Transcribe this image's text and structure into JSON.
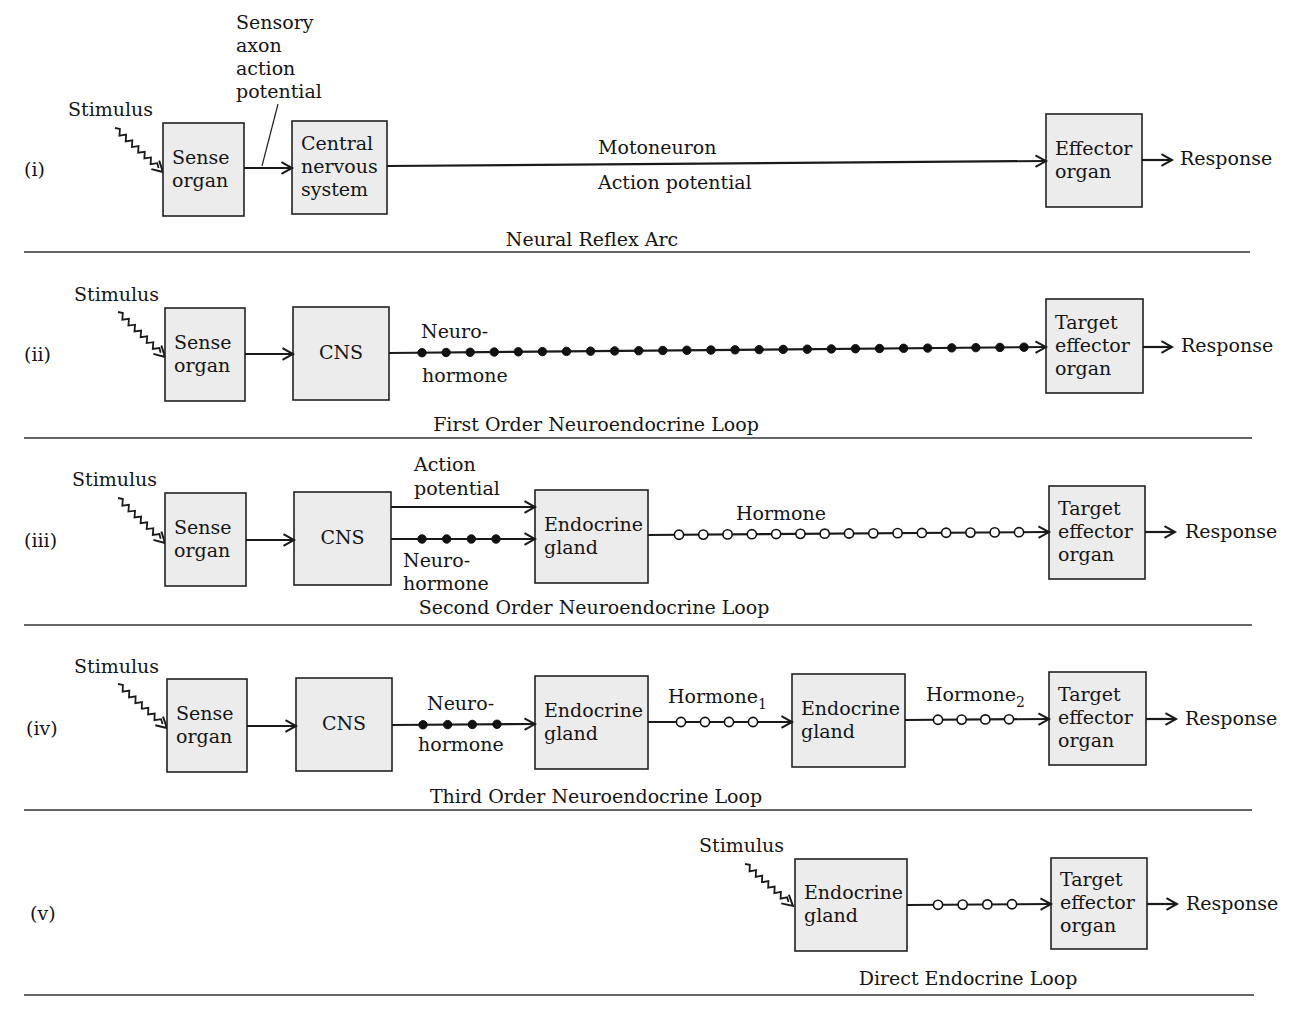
{
  "figure": {
    "panels": [
      {
        "id": "i",
        "numeral": "(i)",
        "caption": "Neural Reflex Arc",
        "numeral_pos": [
          24,
          176
        ],
        "caption_pos": [
          592,
          246
        ],
        "separator_y": 252,
        "separator_x": [
          24,
          1250
        ],
        "stimulus": {
          "label": "Stimulus",
          "label_pos": [
            68,
            116
          ],
          "from": [
            115,
            128
          ],
          "to": [
            163,
            172
          ]
        },
        "boxes": [
          {
            "id": "sense-organ",
            "lines": [
              "Sense",
              "organ"
            ],
            "x": 163,
            "y": 123,
            "w": 81,
            "h": 93
          },
          {
            "id": "central-nervous-system",
            "lines": [
              "Central",
              "nervous",
              "system"
            ],
            "x": 292,
            "y": 121,
            "w": 95,
            "h": 93
          },
          {
            "id": "effector-organ",
            "lines": [
              "Effector",
              "organ"
            ],
            "x": 1046,
            "y": 114,
            "w": 96,
            "h": 93
          }
        ],
        "connections": [
          {
            "from": [
              244,
              168
            ],
            "to": [
              292,
              168
            ],
            "style": "plain",
            "dots": 0
          },
          {
            "from": [
              387,
              166
            ],
            "to": [
              1046,
              161
            ],
            "style": "plain",
            "dots": 0
          },
          {
            "from": [
              1142,
              160
            ],
            "to": [
              1172,
              160
            ],
            "style": "plain",
            "dots": 0
          }
        ],
        "labels": [
          {
            "id": "sensory-axon-label",
            "lines": [
              "Sensory",
              "axon",
              "action",
              "potential"
            ],
            "x": 236,
            "y": 29,
            "lh": 23
          },
          {
            "id": "motoneuron-label",
            "lines": [
              "Motoneuron"
            ],
            "x": 598,
            "y": 154,
            "lh": 22
          },
          {
            "id": "action-potential-label",
            "lines": [
              "Action potential"
            ],
            "x": 598,
            "y": 189,
            "lh": 22
          },
          {
            "id": "response-label",
            "lines": [
              "Response"
            ],
            "x": 1180,
            "y": 165,
            "lh": 22
          }
        ],
        "pointer_lines": [
          {
            "from": [
              278,
              104
            ],
            "to": [
              262,
              166
            ]
          }
        ]
      },
      {
        "id": "ii",
        "numeral": "(ii)",
        "caption": "First Order Neuroendocrine Loop",
        "numeral_pos": [
          24,
          361
        ],
        "caption_pos": [
          596,
          431
        ],
        "separator_y": 438,
        "separator_x": [
          24,
          1252
        ],
        "stimulus": {
          "label": "Stimulus",
          "label_pos": [
            74,
            301
          ],
          "from": [
            118,
            312
          ],
          "to": [
            165,
            357
          ]
        },
        "boxes": [
          {
            "id": "sense-organ",
            "lines": [
              "Sense",
              "organ"
            ],
            "x": 165,
            "y": 308,
            "w": 80,
            "h": 93
          },
          {
            "id": "cns",
            "lines": [
              "CNS"
            ],
            "x": 293,
            "y": 307,
            "w": 96,
            "h": 93,
            "center": true
          },
          {
            "id": "target-effector-organ",
            "lines": [
              "Target",
              "effector",
              "organ"
            ],
            "x": 1046,
            "y": 299,
            "w": 97,
            "h": 94
          }
        ],
        "connections": [
          {
            "from": [
              245,
              354
            ],
            "to": [
              293,
              354
            ],
            "style": "plain",
            "dots": 0
          },
          {
            "from": [
              389,
              353
            ],
            "to": [
              1046,
              347
            ],
            "style": "filled",
            "dots": 26,
            "dot_start": 422,
            "dot_end": 1024
          },
          {
            "from": [
              1143,
              347
            ],
            "to": [
              1172,
              347
            ],
            "style": "plain",
            "dots": 0
          }
        ],
        "labels": [
          {
            "id": "neuro-label",
            "lines": [
              "Neuro-"
            ],
            "x": 421,
            "y": 338,
            "lh": 22
          },
          {
            "id": "hormone-label",
            "lines": [
              "hormone"
            ],
            "x": 422,
            "y": 382,
            "lh": 22
          },
          {
            "id": "response-label",
            "lines": [
              "Response"
            ],
            "x": 1181,
            "y": 352,
            "lh": 22
          }
        ],
        "pointer_lines": []
      },
      {
        "id": "iii",
        "numeral": "(iii)",
        "caption": "Second Order Neuroendocrine Loop",
        "numeral_pos": [
          24,
          547
        ],
        "caption_pos": [
          594,
          614
        ],
        "separator_y": 625,
        "separator_x": [
          24,
          1252
        ],
        "stimulus": {
          "label": "Stimulus",
          "label_pos": [
            72,
            486
          ],
          "from": [
            118,
            498
          ],
          "to": [
            165,
            543
          ]
        },
        "boxes": [
          {
            "id": "sense-organ",
            "lines": [
              "Sense",
              "organ"
            ],
            "x": 165,
            "y": 493,
            "w": 81,
            "h": 93
          },
          {
            "id": "cns",
            "lines": [
              "CNS"
            ],
            "x": 294,
            "y": 492,
            "w": 97,
            "h": 93,
            "center": true
          },
          {
            "id": "endocrine-gland",
            "lines": [
              "Endocrine",
              "gland"
            ],
            "x": 535,
            "y": 490,
            "w": 113,
            "h": 93
          },
          {
            "id": "target-effector-organ",
            "lines": [
              "Target",
              "effector",
              "organ"
            ],
            "x": 1049,
            "y": 486,
            "w": 96,
            "h": 93
          }
        ],
        "connections": [
          {
            "from": [
              246,
              540
            ],
            "to": [
              294,
              540
            ],
            "style": "plain",
            "dots": 0
          },
          {
            "from": [
              391,
              507
            ],
            "to": [
              535,
              507
            ],
            "style": "plain",
            "dots": 0
          },
          {
            "from": [
              391,
              539
            ],
            "to": [
              535,
              539
            ],
            "style": "filled",
            "dots": 4,
            "dot_start": 422,
            "dot_end": 496
          },
          {
            "from": [
              648,
              535
            ],
            "to": [
              1049,
              532
            ],
            "style": "open",
            "dots": 15,
            "dot_start": 679,
            "dot_end": 1019
          },
          {
            "from": [
              1145,
              532
            ],
            "to": [
              1175,
              532
            ],
            "style": "plain",
            "dots": 0
          }
        ],
        "labels": [
          {
            "id": "action-potential-label",
            "lines": [
              "Action",
              "potential"
            ],
            "x": 414,
            "y": 471,
            "lh": 24
          },
          {
            "id": "neurohormone-label",
            "lines": [
              "Neuro-",
              "hormone"
            ],
            "x": 403,
            "y": 567,
            "lh": 23
          },
          {
            "id": "hormone-label",
            "lines": [
              "Hormone"
            ],
            "x": 736,
            "y": 520,
            "lh": 22
          },
          {
            "id": "response-label",
            "lines": [
              "Response"
            ],
            "x": 1185,
            "y": 538,
            "lh": 22
          }
        ],
        "pointer_lines": []
      },
      {
        "id": "iv",
        "numeral": "(iv)",
        "caption": "Third Order Neuroendocrine Loop",
        "numeral_pos": [
          26,
          735
        ],
        "caption_pos": [
          596,
          803
        ],
        "separator_y": 810,
        "separator_x": [
          24,
          1252
        ],
        "stimulus": {
          "label": "Stimulus",
          "label_pos": [
            74,
            673
          ],
          "from": [
            118,
            684
          ],
          "to": [
            167,
            728
          ]
        },
        "boxes": [
          {
            "id": "sense-organ",
            "lines": [
              "Sense",
              "organ"
            ],
            "x": 167,
            "y": 679,
            "w": 80,
            "h": 93
          },
          {
            "id": "cns",
            "lines": [
              "CNS"
            ],
            "x": 296,
            "y": 678,
            "w": 96,
            "h": 93,
            "center": true
          },
          {
            "id": "endocrine-gland-1",
            "lines": [
              "Endocrine",
              "gland"
            ],
            "x": 535,
            "y": 676,
            "w": 113,
            "h": 93
          },
          {
            "id": "endocrine-gland-2",
            "lines": [
              "Endocrine",
              "gland"
            ],
            "x": 792,
            "y": 674,
            "w": 113,
            "h": 93
          },
          {
            "id": "target-effector-organ",
            "lines": [
              "Target",
              "effector",
              "organ"
            ],
            "x": 1049,
            "y": 672,
            "w": 97,
            "h": 93
          }
        ],
        "connections": [
          {
            "from": [
              247,
              726
            ],
            "to": [
              296,
              726
            ],
            "style": "plain",
            "dots": 0
          },
          {
            "from": [
              392,
              725
            ],
            "to": [
              535,
              724
            ],
            "style": "filled",
            "dots": 4,
            "dot_start": 423,
            "dot_end": 497
          },
          {
            "from": [
              648,
              722
            ],
            "to": [
              792,
              722
            ],
            "style": "open",
            "dots": 4,
            "dot_start": 681,
            "dot_end": 753
          },
          {
            "from": [
              905,
              720
            ],
            "to": [
              1049,
              719
            ],
            "style": "open",
            "dots": 4,
            "dot_start": 938,
            "dot_end": 1009
          },
          {
            "from": [
              1146,
              719
            ],
            "to": [
              1176,
              719
            ],
            "style": "plain",
            "dots": 0
          }
        ],
        "labels": [
          {
            "id": "neuro-label",
            "lines": [
              "Neuro-"
            ],
            "x": 427,
            "y": 710,
            "lh": 22
          },
          {
            "id": "hormone-label",
            "lines": [
              "hormone"
            ],
            "x": 418,
            "y": 751,
            "lh": 22
          },
          {
            "id": "hormone1-label",
            "lines": [
              "Hormone"
            ],
            "sub": "1",
            "x": 668,
            "y": 703,
            "lh": 22
          },
          {
            "id": "hormone2-label",
            "lines": [
              "Hormone"
            ],
            "sub": "2",
            "x": 926,
            "y": 701,
            "lh": 22
          },
          {
            "id": "response-label",
            "lines": [
              "Response"
            ],
            "x": 1185,
            "y": 725,
            "lh": 22
          }
        ],
        "pointer_lines": []
      },
      {
        "id": "v",
        "numeral": "(v)",
        "caption": "Direct Endocrine Loop",
        "numeral_pos": [
          30,
          920
        ],
        "caption_pos": [
          968,
          985
        ],
        "separator_y": 995,
        "separator_x": [
          24,
          1254
        ],
        "stimulus": {
          "label": "Stimulus",
          "label_pos": [
            699,
            852
          ],
          "from": [
            745,
            864
          ],
          "to": [
            793,
            906
          ]
        },
        "boxes": [
          {
            "id": "endocrine-gland",
            "lines": [
              "Endocrine",
              "gland"
            ],
            "x": 795,
            "y": 859,
            "w": 112,
            "h": 92
          },
          {
            "id": "target-effector-organ",
            "lines": [
              "Target",
              "effector",
              "organ"
            ],
            "x": 1051,
            "y": 858,
            "w": 96,
            "h": 91
          }
        ],
        "connections": [
          {
            "from": [
              907,
              905
            ],
            "to": [
              1051,
              904
            ],
            "style": "open",
            "dots": 4,
            "dot_start": 938,
            "dot_end": 1012
          },
          {
            "from": [
              1147,
              904
            ],
            "to": [
              1177,
              904
            ],
            "style": "plain",
            "dots": 0
          }
        ],
        "labels": [
          {
            "id": "response-label",
            "lines": [
              "Response"
            ],
            "x": 1186,
            "y": 910,
            "lh": 22
          }
        ],
        "pointer_lines": []
      }
    ]
  },
  "colors": {
    "box_fill": "#ececec",
    "stroke": "#1a1a1a",
    "text": "#151515",
    "background": "#ffffff"
  }
}
